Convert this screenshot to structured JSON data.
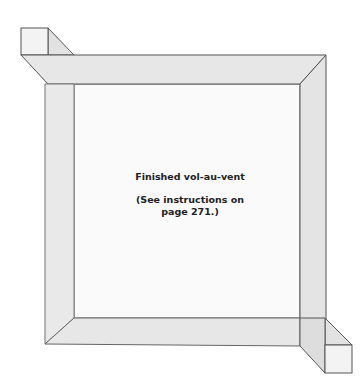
{
  "diagram": {
    "title": "Finished vol-au-vent",
    "note_line1": "(See instructions on",
    "note_line2": "page 271.)",
    "colors": {
      "band_fill": "#e6e6e6",
      "band_dark": "#dcdcdc",
      "inner_fill": "#fafafa",
      "stroke": "#555555"
    }
  }
}
